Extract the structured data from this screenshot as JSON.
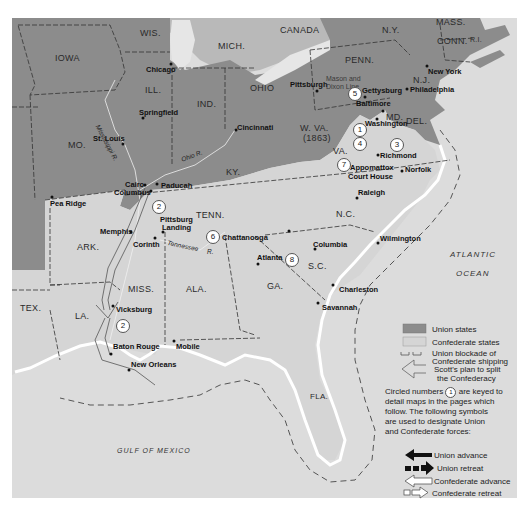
{
  "colors": {
    "union": "#8c8c8c",
    "confederate": "#d5d5d5",
    "water": "#dcdcdc",
    "coast": "#ffffff",
    "border": "#333333"
  },
  "states": {
    "iowa": "IOWA",
    "wis": "WIS.",
    "mich": "MICH.",
    "ill": "ILL.",
    "ind": "IND.",
    "ohio": "OHIO",
    "penn": "PENN.",
    "ny": "N.Y.",
    "mass": "MASS.",
    "conn": "CONN.",
    "ri": "R.I.",
    "nj": "N.J.",
    "md": "MD.",
    "del": "DEL.",
    "wva": "W. VA.",
    "wva_year": "(1863)",
    "mo": "MO.",
    "ky": "KY.",
    "va": "VA.",
    "nc": "N.C.",
    "sc": "S.C.",
    "tenn": "TENN.",
    "ark": "ARK.",
    "miss": "MISS.",
    "ala": "ALA.",
    "ga": "GA.",
    "fla": "FLA.",
    "la": "LA.",
    "tex": "TEX.",
    "canada": "CANADA"
  },
  "cities": {
    "chicago": "Chicago",
    "springfield": "Springfield",
    "st_louis": "St. Louis",
    "cincinnati": "Cincinnati",
    "pittsburgh": "Pittsburgh",
    "gettysburg": "Gettysburg",
    "philadelphia": "Philadelphia",
    "new_york": "New York",
    "baltimore": "Baltimore",
    "washington": "Washington",
    "richmond": "Richmond",
    "appomattox": "Appomattox",
    "court_house": "Court House",
    "norfolk": "Norfolk",
    "raleigh": "Raleigh",
    "wilmington": "Wilmington",
    "columbia": "Columbia",
    "charleston": "Charleston",
    "savannah": "Savannah",
    "atlanta": "Atlanta",
    "chattanooga": "Chattanooga",
    "cairo": "Cairo",
    "columbus": "Columbus",
    "paducah": "Paducah",
    "pea_ridge": "Pea Ridge",
    "memphis": "Memphis",
    "pittsburg": "Pittsburg",
    "landing": "Landing",
    "corinth": "Corinth",
    "vicksburg": "Vicksburg",
    "baton_rouge": "Baton Rouge",
    "new_orleans": "New Orleans",
    "mobile": "Mobile"
  },
  "rivers": {
    "mississippi": "Mississippi R.",
    "ohio": "Ohio R.",
    "tennessee": "Tennessee",
    "tennessee_r": "R."
  },
  "mason_dixon": {
    "line1": "Mason and",
    "line2": "Dixon Line"
  },
  "water_labels": {
    "atlantic": "ATLANTIC",
    "ocean": "OCEAN",
    "gulf": "GULF OF MEXICO"
  },
  "circled_numbers": [
    "1",
    "2",
    "2",
    "3",
    "4",
    "5",
    "6",
    "7",
    "8"
  ],
  "legend": {
    "union_states": "Union states",
    "confederate_states": "Confederate states",
    "blockade_1": "Union blockade of",
    "blockade_2": "Confederate shipping",
    "scott_1": "Scott's plan to split",
    "scott_2": "the Confederacy",
    "note_1": "Circled numbers",
    "note_1b": "are keyed to",
    "note_2": "detail maps in the pages which",
    "note_3": "follow. The following symbols",
    "note_4": "are used to designate Union",
    "note_5": "and Confederate forces:",
    "note_num": "1",
    "union_advance": "Union advance",
    "union_retreat": "Union retreat",
    "confederate_advance": "Confederate advance",
    "confederate_retreat": "Confederate retreat"
  }
}
